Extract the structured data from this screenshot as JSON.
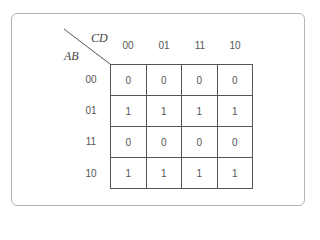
{
  "kmap": {
    "row_var": "AB",
    "col_var": "CD",
    "col_headers": [
      "00",
      "01",
      "11",
      "10"
    ],
    "row_headers": [
      "00",
      "01",
      "11",
      "10"
    ],
    "cells": [
      [
        "0",
        "0",
        "0",
        "0"
      ],
      [
        "1",
        "1",
        "1",
        "1"
      ],
      [
        "0",
        "0",
        "0",
        "0"
      ],
      [
        "1",
        "1",
        "1",
        "1"
      ]
    ]
  }
}
